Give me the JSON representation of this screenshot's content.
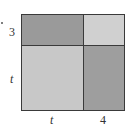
{
  "diagram": {
    "labels": {
      "left_top": "3",
      "left_bottom": "t",
      "bottom_left": "t",
      "bottom_right": "4"
    },
    "regions": [
      {
        "name": "top-left",
        "dims": "t x 3",
        "color": "#9a9a9a"
      },
      {
        "name": "top-right",
        "dims": "4 x 3",
        "color": "#d0d0d0"
      },
      {
        "name": "bottom-left",
        "dims": "t x t",
        "color": "#c8c8c8"
      },
      {
        "name": "bottom-right",
        "dims": "4 x t",
        "color": "#9e9e9e"
      }
    ]
  }
}
